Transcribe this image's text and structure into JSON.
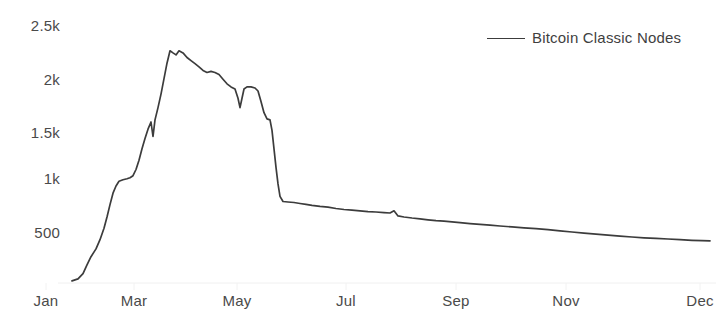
{
  "chart_data": {
    "type": "line",
    "title": "",
    "subtitle": "",
    "xlabel": "",
    "ylabel": "",
    "grid": false,
    "legend_position": "top-right",
    "ylim": [
      0,
      2500
    ],
    "yticks": [
      500,
      1000,
      1500,
      2000,
      2500
    ],
    "ytick_labels": [
      "500",
      "1k",
      "1.5k",
      "2k",
      "2.5k"
    ],
    "xticks": [
      "Jan",
      "Mar",
      "May",
      "Jul",
      "Sep",
      "Nov",
      "Dec"
    ],
    "xtick_positions_px": [
      46,
      134,
      237,
      346,
      456,
      566,
      700
    ],
    "line_color": "#3c3c3c",
    "series": [
      {
        "name": "Bitcoin Classic Nodes",
        "x": [
          "Jan",
          "Mar",
          "May",
          "Jul",
          "Sep",
          "Nov",
          "Dec"
        ],
        "points": [
          [
            72,
            20
          ],
          [
            78,
            40
          ],
          [
            83,
            90
          ],
          [
            87,
            175
          ],
          [
            91,
            255
          ],
          [
            96,
            330
          ],
          [
            100,
            420
          ],
          [
            104,
            530
          ],
          [
            107,
            640
          ],
          [
            110,
            760
          ],
          [
            113,
            870
          ],
          [
            116,
            940
          ],
          [
            119,
            985
          ],
          [
            123,
            1000
          ],
          [
            127,
            1010
          ],
          [
            130,
            1020
          ],
          [
            133,
            1040
          ],
          [
            136,
            1100
          ],
          [
            139,
            1190
          ],
          [
            142,
            1300
          ],
          [
            145,
            1400
          ],
          [
            148,
            1490
          ],
          [
            151,
            1560
          ],
          [
            153,
            1420
          ],
          [
            155,
            1580
          ],
          [
            158,
            1700
          ],
          [
            161,
            1830
          ],
          [
            164,
            1980
          ],
          [
            167,
            2130
          ],
          [
            170,
            2250
          ],
          [
            173,
            2230
          ],
          [
            176,
            2210
          ],
          [
            179,
            2250
          ],
          [
            183,
            2230
          ],
          [
            187,
            2185
          ],
          [
            191,
            2155
          ],
          [
            195,
            2125
          ],
          [
            199,
            2095
          ],
          [
            203,
            2060
          ],
          [
            207,
            2040
          ],
          [
            211,
            2050
          ],
          [
            215,
            2040
          ],
          [
            219,
            2020
          ],
          [
            223,
            1975
          ],
          [
            227,
            1930
          ],
          [
            231,
            1900
          ],
          [
            235,
            1880
          ],
          [
            238,
            1790
          ],
          [
            240,
            1700
          ],
          [
            242,
            1790
          ],
          [
            244,
            1880
          ],
          [
            247,
            1900
          ],
          [
            251,
            1900
          ],
          [
            255,
            1890
          ],
          [
            258,
            1860
          ],
          [
            261,
            1760
          ],
          [
            264,
            1650
          ],
          [
            267,
            1590
          ],
          [
            270,
            1580
          ],
          [
            272,
            1480
          ],
          [
            274,
            1300
          ],
          [
            276,
            1120
          ],
          [
            278,
            960
          ],
          [
            280,
            840
          ],
          [
            283,
            790
          ],
          [
            288,
            785
          ],
          [
            294,
            780
          ],
          [
            300,
            770
          ],
          [
            306,
            762
          ],
          [
            312,
            752
          ],
          [
            320,
            742
          ],
          [
            328,
            735
          ],
          [
            336,
            722
          ],
          [
            344,
            712
          ],
          [
            352,
            705
          ],
          [
            360,
            700
          ],
          [
            368,
            692
          ],
          [
            376,
            688
          ],
          [
            384,
            682
          ],
          [
            390,
            678
          ],
          [
            394,
            700
          ],
          [
            398,
            650
          ],
          [
            404,
            640
          ],
          [
            412,
            630
          ],
          [
            420,
            622
          ],
          [
            428,
            612
          ],
          [
            436,
            604
          ],
          [
            444,
            600
          ],
          [
            452,
            592
          ],
          [
            460,
            584
          ],
          [
            470,
            576
          ],
          [
            480,
            568
          ],
          [
            490,
            560
          ],
          [
            500,
            552
          ],
          [
            512,
            544
          ],
          [
            524,
            534
          ],
          [
            536,
            526
          ],
          [
            548,
            516
          ],
          [
            560,
            506
          ],
          [
            572,
            494
          ],
          [
            584,
            484
          ],
          [
            596,
            474
          ],
          [
            608,
            464
          ],
          [
            620,
            454
          ],
          [
            632,
            446
          ],
          [
            644,
            438
          ],
          [
            656,
            432
          ],
          [
            668,
            426
          ],
          [
            680,
            420
          ],
          [
            692,
            414
          ],
          [
            702,
            410
          ],
          [
            710,
            408
          ]
        ]
      }
    ]
  },
  "legend": {
    "label": "Bitcoin Classic Nodes"
  },
  "axes": {
    "y_labels": [
      "2.5k",
      "2k",
      "1.5k",
      "1k",
      "500"
    ],
    "x_labels": [
      "Jan",
      "Mar",
      "May",
      "Jul",
      "Sep",
      "Nov",
      "Dec"
    ]
  }
}
